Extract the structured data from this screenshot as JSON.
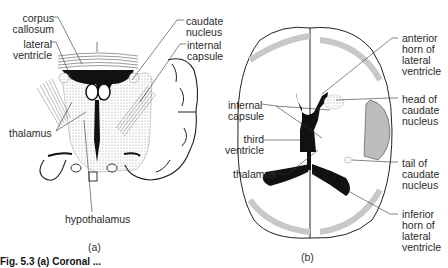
{
  "figure": {
    "caption_fragment": "Fig. 5.3 (a) Coronal ...",
    "panels": [
      {
        "id": "a",
        "caption": "(a)",
        "view": "coronal section",
        "labels": [
          {
            "text": "corpus\ncallosum"
          },
          {
            "text": "lateral\nventricle"
          },
          {
            "text": "caudate\nnucleus"
          },
          {
            "text": "internal\ncapsule"
          },
          {
            "text": "thalamus"
          },
          {
            "text": "hypothalamus"
          }
        ]
      },
      {
        "id": "b",
        "caption": "(b)",
        "view": "horizontal section",
        "labels": [
          {
            "text": "anterior\nhorn of\nlateral\nventricle"
          },
          {
            "text": "head of\ncaudate\nnucleus"
          },
          {
            "text": "internal\ncapsule"
          },
          {
            "text": "third\nventricle"
          },
          {
            "text": "thalamus"
          },
          {
            "text": "tail of\ncaudate\nnucleus"
          },
          {
            "text": "inferior\nhorn of\nlateral\nventricle"
          }
        ]
      }
    ]
  },
  "colors": {
    "ink": "#1a1a1a",
    "stipple": "#c8c8c8",
    "shade": "#bdbdbd"
  }
}
